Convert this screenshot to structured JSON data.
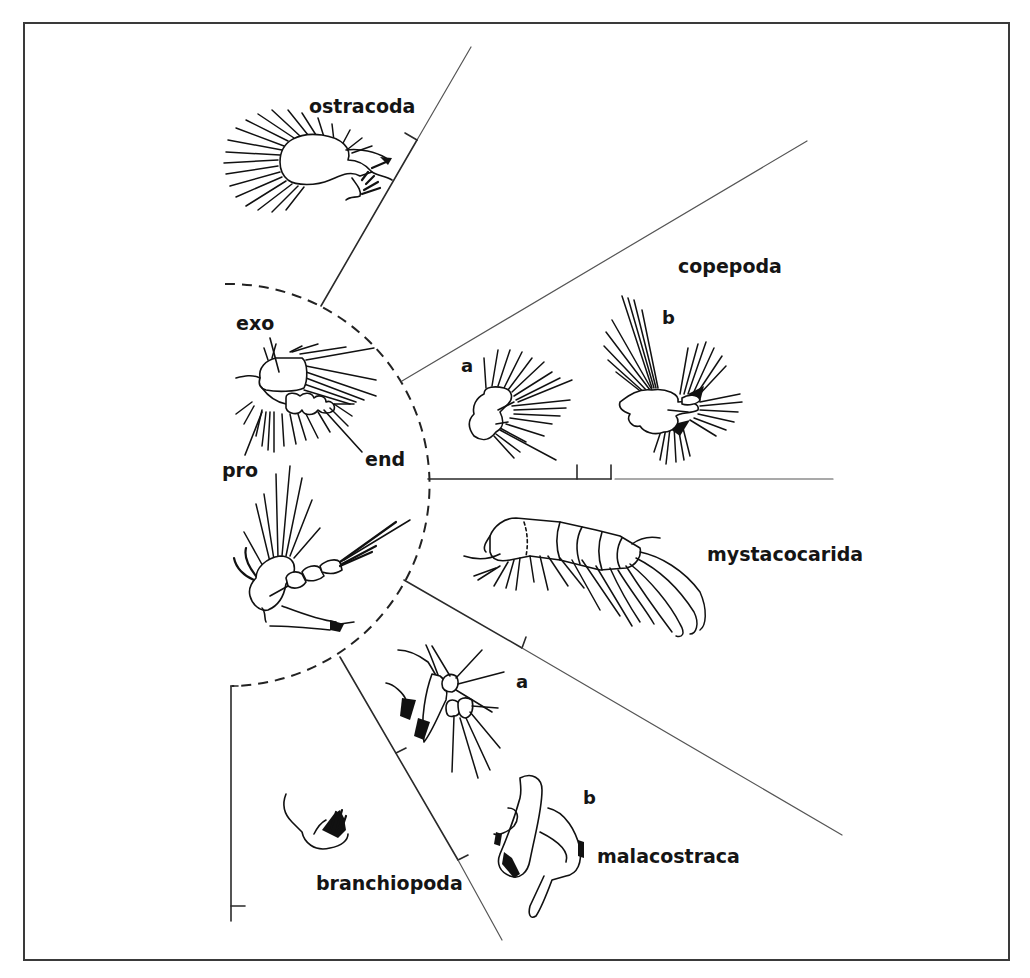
{
  "figure": {
    "colors": {
      "background": "#ffffff",
      "ink": "#111111",
      "frame": "#3a3a3a"
    },
    "central_appendage_labels": {
      "exopod": "exo",
      "protopod": "pro",
      "endopod": "end"
    },
    "groups": [
      {
        "id": "ostracoda",
        "label": "ostracoda",
        "parts": []
      },
      {
        "id": "copepoda",
        "label": "copepoda",
        "parts": [
          "a",
          "b"
        ]
      },
      {
        "id": "mystacocarida",
        "label": "mystacocarida",
        "parts": []
      },
      {
        "id": "malacostraca",
        "label": "malacostraca",
        "parts": [
          "a",
          "b"
        ]
      },
      {
        "id": "branchiopoda",
        "label": "branchiopoda",
        "parts": []
      }
    ],
    "copepoda": {
      "part_a": "a",
      "part_b": "b"
    },
    "malacostraca": {
      "part_a": "a",
      "part_b": "b"
    }
  }
}
